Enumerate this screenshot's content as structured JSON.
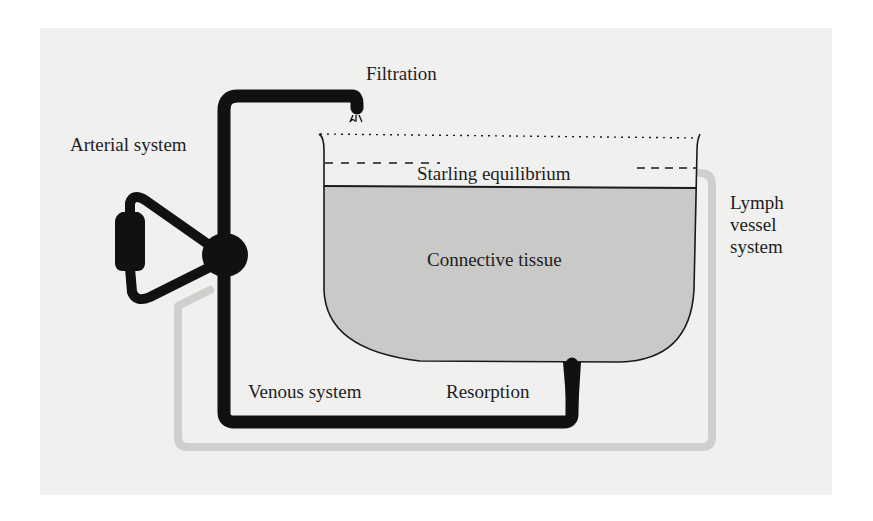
{
  "diagram": {
    "type": "flow-schematic",
    "labels": {
      "filtration": "Filtration",
      "arterial_system": "Arterial system",
      "starling_equilibrium": "Starling equilibrium",
      "connective_tissue": "Connective tissue",
      "lymph_line1": "Lymph",
      "lymph_line2": "vessel",
      "lymph_line3": "system",
      "venous_system": "Venous system",
      "resorption": "Resorption"
    },
    "colors": {
      "background": "#ffffff",
      "panel": "#f0f0ef",
      "vessel_black": "#111111",
      "tissue_fill": "#c9c9c7",
      "lymph_gray": "#cfcfcd",
      "outline": "#1a1a1a",
      "text": "#1e1e1e"
    },
    "nodes": [
      {
        "id": "heart-pump",
        "label": "pump (heart)"
      },
      {
        "id": "junction",
        "label": "circulation junction"
      },
      {
        "id": "tissue-basin",
        "label": "Connective tissue"
      },
      {
        "id": "lymph-return",
        "label": "Lymph vessel system"
      }
    ],
    "edges": [
      {
        "from": "junction",
        "to": "tissue-basin",
        "label": "Filtration"
      },
      {
        "from": "tissue-basin",
        "to": "junction",
        "label": "Resorption"
      },
      {
        "from": "tissue-basin",
        "to": "junction",
        "label": "Lymph vessel system"
      }
    ]
  }
}
